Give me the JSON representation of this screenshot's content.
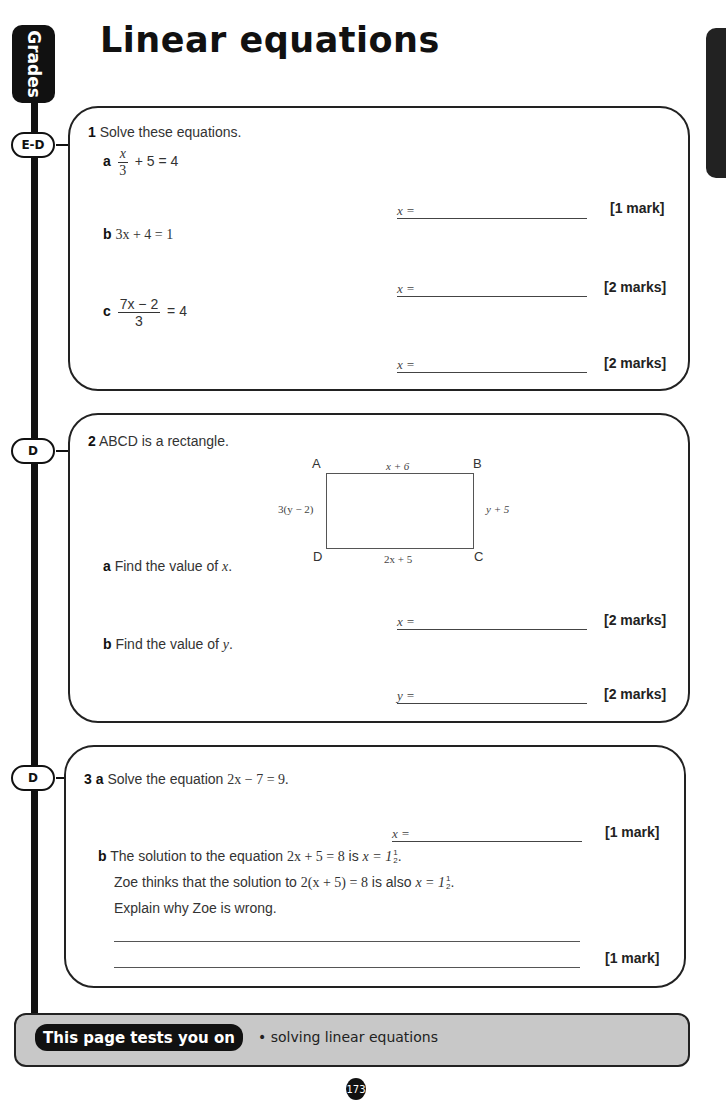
{
  "page": {
    "title": "Linear equations",
    "side_tab_label": "Grades",
    "page_number": "173"
  },
  "questions": [
    {
      "number": "1",
      "grade": "E-D",
      "prompt": "Solve these equations.",
      "parts": [
        {
          "letter": "a",
          "equation": {
            "numerator": "x",
            "denominator": "3",
            "rest": "+ 5 = 4"
          },
          "answer_label": "x =",
          "marks": "[1 mark]"
        },
        {
          "letter": "b",
          "equation_text": "3x + 4 = 1",
          "answer_label": "x =",
          "marks": "[2 marks]"
        },
        {
          "letter": "c",
          "equation": {
            "numerator": "7x − 2",
            "denominator": "3",
            "rest": "= 4"
          },
          "answer_label": "x =",
          "marks": "[2 marks]"
        }
      ]
    },
    {
      "number": "2",
      "grade": "D",
      "prompt": "ABCD is a rectangle.",
      "diagram": {
        "vertices": [
          "A",
          "B",
          "C",
          "D"
        ],
        "top": "x + 6",
        "bottom": "2x + 5",
        "left": "3(y − 2)",
        "right": "y + 5"
      },
      "parts": [
        {
          "letter": "a",
          "text": "Find the value of",
          "var": "x",
          "answer_label": "x =",
          "marks": "[2 marks]"
        },
        {
          "letter": "b",
          "text": "Find the value of",
          "var": "y",
          "answer_label": "y =",
          "marks": "[2 marks]"
        }
      ]
    },
    {
      "number": "3",
      "grade": "D",
      "parts": [
        {
          "letter": "a",
          "text": "Solve the equation",
          "equation_text": "2x − 7 = 9.",
          "answer_label": "x =",
          "marks": "[1 mark]"
        },
        {
          "letter": "b",
          "line1_pre": "The solution to the equation",
          "line1_eq": "2x + 5 = 8",
          "line1_mid": "is",
          "line1_sol": "x = 1",
          "line2_pre": "Zoe thinks that the solution to",
          "line2_eq": "2(x + 5) = 8",
          "line2_mid": "is also",
          "line2_sol": "x = 1",
          "frac_num": "1",
          "frac_den": "2",
          "line3": "Explain why Zoe is wrong.",
          "marks": "[1 mark]"
        }
      ]
    }
  ],
  "footer": {
    "label": "This page tests you on",
    "topic": "• solving linear equations"
  }
}
